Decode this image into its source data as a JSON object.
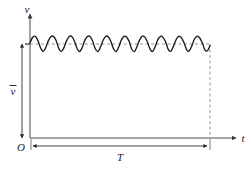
{
  "figure": {
    "caption": "",
    "axes": {
      "y_axis_label": "v",
      "x_axis_label": "t",
      "origin_label": "O"
    },
    "annotations": {
      "mean_level_label": "v",
      "mean_level_overbar": "‾",
      "period_label": "T"
    },
    "colors": {
      "background": "#ffffff",
      "curve": "#1a1a1a",
      "axis": "#4a4a4a",
      "dashed": "#7a7a7a",
      "dimension": "#3a3a3a",
      "text": "#1a1a1a"
    }
  },
  "chart_data": {
    "type": "line",
    "title": "",
    "xlabel": "t",
    "ylabel": "v",
    "grid": false,
    "legend": null,
    "annotations": [
      {
        "name": "mean-level",
        "text": "v̄",
        "kind": "vertical-dimension",
        "from": [
          0,
          0
        ],
        "to": [
          0,
          1.0
        ],
        "description": "Average (mean) value of v, measured from the t-axis up to the dashed mean line"
      },
      {
        "name": "period",
        "text": "T",
        "kind": "horizontal-dimension",
        "from": [
          0,
          0
        ],
        "to": [
          1.0,
          0
        ],
        "description": "Total time interval T along the t-axis"
      }
    ],
    "reference_lines": [
      {
        "name": "mean-value-line",
        "orientation": "horizontal",
        "value": 1.0,
        "style": "dashed"
      },
      {
        "name": "period-end-line",
        "orientation": "vertical",
        "value": 1.0,
        "style": "dashed"
      }
    ],
    "xlim": [
      0,
      1.08
    ],
    "ylim": [
      0,
      1.35
    ],
    "series": [
      {
        "name": "ripple-voltage",
        "style": "solid",
        "mean": 1.0,
        "ripple_amplitude": 0.085,
        "cycles": 11.5,
        "x": [
          0.0,
          0.014,
          0.029,
          0.043,
          0.058,
          0.072,
          0.087,
          0.101,
          0.116,
          0.13,
          0.145,
          0.159,
          0.174,
          0.188,
          0.203,
          0.217,
          0.232,
          0.246,
          0.261,
          0.275,
          0.29,
          0.304,
          0.319,
          0.333,
          0.348,
          0.362,
          0.377,
          0.391,
          0.406,
          0.42,
          0.435,
          0.449,
          0.464,
          0.478,
          0.493,
          0.507,
          0.522,
          0.536,
          0.551,
          0.565,
          0.58,
          0.594,
          0.609,
          0.623,
          0.638,
          0.652,
          0.667,
          0.681,
          0.696,
          0.71,
          0.725,
          0.739,
          0.754,
          0.768,
          0.783,
          0.797,
          0.812,
          0.826,
          0.841,
          0.855,
          0.87,
          0.884,
          0.899,
          0.913,
          0.928,
          0.942,
          0.957,
          0.971,
          0.986,
          1.0
        ],
        "y": [
          1.012,
          1.069,
          1.082,
          1.041,
          0.962,
          0.923,
          0.958,
          1.031,
          1.077,
          1.081,
          1.038,
          0.958,
          0.921,
          0.959,
          1.033,
          1.078,
          1.08,
          1.035,
          0.955,
          0.92,
          0.962,
          1.036,
          1.079,
          1.079,
          1.032,
          0.952,
          0.919,
          0.965,
          1.039,
          1.08,
          1.077,
          1.029,
          0.949,
          0.919,
          0.968,
          1.041,
          1.081,
          1.075,
          1.026,
          0.947,
          0.92,
          0.971,
          1.044,
          1.081,
          1.073,
          1.023,
          0.945,
          0.921,
          0.974,
          1.046,
          1.082,
          1.071,
          1.02,
          0.943,
          0.923,
          0.977,
          1.048,
          1.082,
          1.068,
          1.017,
          0.941,
          0.925,
          0.98,
          1.05,
          1.082,
          1.066,
          1.014,
          0.939,
          0.928,
          0.983
        ]
      }
    ]
  }
}
